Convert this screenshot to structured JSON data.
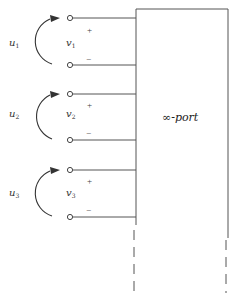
{
  "diagram": {
    "type": "circuit-multiport",
    "box_label": "∞-port",
    "colors": {
      "line": "#555555",
      "text": "#333333",
      "background": "#ffffff"
    },
    "ports": [
      {
        "input_label": "u",
        "input_sub": "1",
        "voltage_label": "v",
        "voltage_sub": "1",
        "plus": "+",
        "minus": "−",
        "top_y": 18,
        "bottom_y": 65
      },
      {
        "input_label": "u",
        "input_sub": "2",
        "voltage_label": "v",
        "voltage_sub": "2",
        "plus": "+",
        "minus": "−",
        "top_y": 94,
        "bottom_y": 140
      },
      {
        "input_label": "u",
        "input_sub": "3",
        "voltage_label": "v",
        "voltage_sub": "3",
        "plus": "+",
        "minus": "−",
        "top_y": 170,
        "bottom_y": 217
      }
    ],
    "continuation": "dashed lines indicating infinitely many ports"
  }
}
